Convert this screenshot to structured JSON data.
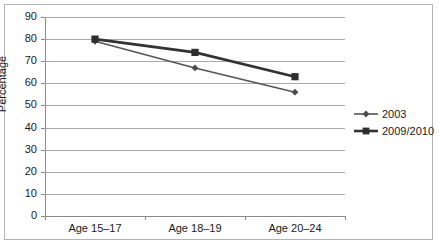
{
  "chart_data": {
    "type": "line",
    "title": "",
    "xlabel": "",
    "ylabel": "Percentage",
    "categories": [
      "Age 15–17",
      "Age 18–19",
      "Age 20–24"
    ],
    "ylim": [
      0,
      90
    ],
    "yticks": [
      0,
      10,
      20,
      30,
      40,
      50,
      60,
      70,
      80,
      90
    ],
    "ytick_labels": [
      "0",
      "10",
      "20",
      "30",
      "40",
      "50",
      "60",
      "70",
      "80",
      "90"
    ],
    "grid": true,
    "legend_position": "right",
    "series": [
      {
        "name": "2003",
        "marker": "diamond",
        "color": "#555555",
        "line_width": 1.6,
        "values": [
          79,
          67,
          56
        ]
      },
      {
        "name": "2009/2010",
        "marker": "square",
        "color": "#333333",
        "line_width": 2.6,
        "values": [
          80,
          74,
          63
        ]
      }
    ]
  },
  "legend": {
    "items": [
      {
        "label": "2003"
      },
      {
        "label": "2009/2010"
      }
    ]
  },
  "colors": {
    "series_2003": "#555555",
    "series_2009_2010": "#333333",
    "gridline": "#a9a9a9",
    "axis": "#8a8a8a",
    "frame": "#b4b4b4",
    "text": "#1a1a1a",
    "background": "#ffffff"
  }
}
